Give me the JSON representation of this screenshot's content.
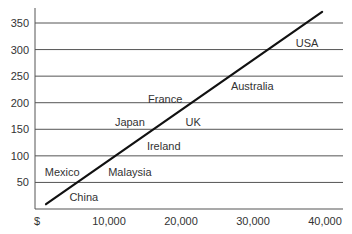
{
  "chart_data": {
    "type": "scatter",
    "title": "",
    "xlabel": "",
    "ylabel": "",
    "xlim": [
      0,
      40000
    ],
    "ylim": [
      0,
      350
    ],
    "grid": {
      "horizontal": true,
      "vertical": false
    },
    "legend": null,
    "x_ticks": [
      "$",
      "10,000",
      "20,000",
      "30,000",
      "40,000"
    ],
    "x_tick_values": [
      0,
      10000,
      20000,
      30000,
      40000
    ],
    "y_ticks": [
      "50",
      "100",
      "150",
      "200",
      "250",
      "300",
      "350"
    ],
    "y_tick_values": [
      50,
      100,
      150,
      200,
      250,
      300,
      350
    ],
    "points": [
      {
        "label": "USA",
        "x": 37500,
        "y": 312
      },
      {
        "label": "Australia",
        "x": 29900,
        "y": 232
      },
      {
        "label": "France",
        "x": 17800,
        "y": 207
      },
      {
        "label": "Japan",
        "x": 12900,
        "y": 164
      },
      {
        "label": "UK",
        "x": 21700,
        "y": 164
      },
      {
        "label": "Ireland",
        "x": 17600,
        "y": 119
      },
      {
        "label": "Mexico",
        "x": 3500,
        "y": 70
      },
      {
        "label": "Malaysia",
        "x": 12900,
        "y": 70
      },
      {
        "label": "China",
        "x": 6500,
        "y": 23
      }
    ],
    "trend_line": {
      "x": [
        1250,
        39600
      ],
      "y": [
        9,
        371
      ]
    },
    "colors": {
      "line": "#111111",
      "grid": "#555555",
      "text": "#333333",
      "background": "#ffffff"
    }
  }
}
